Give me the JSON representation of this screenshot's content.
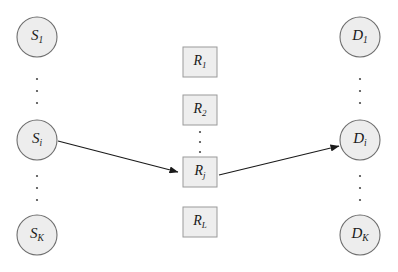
{
  "figure": {
    "background_color": "#ffffff",
    "width": 398,
    "height": 272
  },
  "style": {
    "circle_fill": "#ededed",
    "circle_stroke": "#6e6e6e",
    "box_fill": "#eeeeee",
    "box_stroke": "#9a9a9a",
    "arrow_color": "#1a1a1a",
    "dot_color": "#4a4a4a",
    "label_color": "#1a1a1a"
  },
  "columns": {
    "sources": {
      "name": "source-column",
      "center_x": 37,
      "nodes": [
        {
          "id": "S1",
          "base": "S",
          "sub": "1",
          "cx": 37,
          "cy": 37,
          "r": 20
        },
        {
          "id": "Si",
          "base": "S",
          "sub": "i",
          "cx": 37,
          "cy": 140,
          "r": 20
        },
        {
          "id": "SK",
          "base": "S",
          "sub": "K",
          "cx": 37,
          "cy": 235,
          "r": 20
        }
      ],
      "ellipses": [
        {
          "x": 37,
          "ys": [
            79,
            91,
            103
          ]
        },
        {
          "x": 37,
          "ys": [
            176,
            188,
            200
          ]
        }
      ]
    },
    "relays": {
      "name": "relay-column",
      "center_x": 200,
      "nodes": [
        {
          "id": "R1",
          "base": "R",
          "sub": "1",
          "cx": 200,
          "cy": 62,
          "w": 34,
          "h": 30
        },
        {
          "id": "R2",
          "base": "R",
          "sub": "2",
          "cx": 200,
          "cy": 110,
          "w": 34,
          "h": 30
        },
        {
          "id": "Rj",
          "base": "R",
          "sub": "j",
          "cx": 200,
          "cy": 172,
          "w": 34,
          "h": 30
        },
        {
          "id": "RL",
          "base": "R",
          "sub": "L",
          "cx": 200,
          "cy": 222,
          "w": 34,
          "h": 30
        }
      ],
      "ellipses": [
        {
          "x": 200,
          "ys": [
            132,
            142,
            152
          ]
        }
      ]
    },
    "destinations": {
      "name": "destination-column",
      "center_x": 360,
      "nodes": [
        {
          "id": "D1",
          "base": "D",
          "sub": "1",
          "cx": 360,
          "cy": 37,
          "r": 20
        },
        {
          "id": "Di",
          "base": "D",
          "sub": "i",
          "cx": 360,
          "cy": 140,
          "r": 20
        },
        {
          "id": "DK",
          "base": "D",
          "sub": "K",
          "cx": 360,
          "cy": 235,
          "r": 20
        }
      ],
      "ellipses": [
        {
          "x": 360,
          "ys": [
            79,
            91,
            103
          ]
        },
        {
          "x": 360,
          "ys": [
            176,
            188,
            200
          ]
        }
      ]
    }
  },
  "edges": [
    {
      "id": "edge-si-rj",
      "label": "source-i-to-relay-j",
      "from": "Si",
      "to": "Rj",
      "x1": 58,
      "y1": 141,
      "x2": 178,
      "y2": 172
    },
    {
      "id": "edge-rj-di",
      "label": "relay-j-to-destination-i",
      "from": "Rj",
      "to": "Di",
      "x1": 219,
      "y1": 175,
      "x2": 339,
      "y2": 146
    }
  ]
}
